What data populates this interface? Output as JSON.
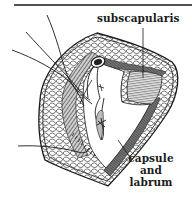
{
  "figure": {
    "type": "surgical anatomical illustration",
    "labels": {
      "subscapularis": "subscapularis",
      "capsule_line1": "capsule",
      "capsule_line2": "and",
      "capsule_line3": "labrum"
    },
    "colors": {
      "ink": "#1a1a1a",
      "background": "#ffffff",
      "muscle_shade": "#6e6e6e",
      "hatch": "#9a9a9a"
    }
  }
}
